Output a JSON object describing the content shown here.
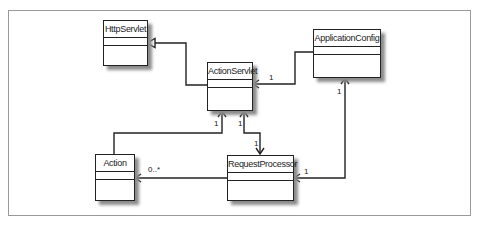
{
  "diagram": {
    "type": "UML class diagram",
    "classes": [
      {
        "id": "HttpServlet",
        "name": "HttpServlet"
      },
      {
        "id": "ActionServlet",
        "name": "ActionServlet"
      },
      {
        "id": "ApplicationConfig",
        "name": "ApplicationConfig"
      },
      {
        "id": "Action",
        "name": "Action"
      },
      {
        "id": "RequestProcessor",
        "name": "RequestProcessor"
      }
    ],
    "relationships": [
      {
        "from": "ActionServlet",
        "to": "HttpServlet",
        "kind": "generalization"
      },
      {
        "from": "ApplicationConfig",
        "to": "ActionServlet",
        "kind": "association",
        "target_multiplicity": "1"
      },
      {
        "from": "Action",
        "to": "ActionServlet",
        "kind": "association",
        "target_multiplicity": "1"
      },
      {
        "from": "ActionServlet",
        "to": "RequestProcessor",
        "kind": "bidirectional-association",
        "source_multiplicity": "1",
        "target_multiplicity": "1"
      },
      {
        "from": "RequestProcessor",
        "to": "Action",
        "kind": "association",
        "target_multiplicity": "0..*"
      },
      {
        "from": "RequestProcessor",
        "to": "ApplicationConfig",
        "kind": "bidirectional-association",
        "source_multiplicity": "1",
        "target_multiplicity": "1"
      }
    ],
    "labels": {
      "appconfig_to_actionservlet": "1",
      "action_to_actionservlet": "1",
      "actionservlet_end": "1",
      "requestprocessor_end": "1",
      "requestprocessor_to_action": "0..*",
      "requestprocessor_appconfig_end": "1",
      "appconfig_end": "1"
    }
  }
}
